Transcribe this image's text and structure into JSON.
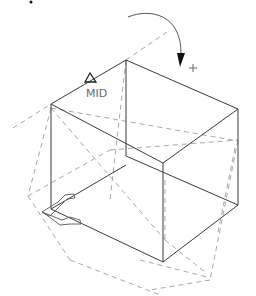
{
  "viewport": {
    "title": "Rotate 3D preview",
    "snap_marker": {
      "label": "MID",
      "glyph": "triangle-midpoint-icon",
      "position": [
        91,
        76
      ]
    },
    "rotate_indicator": {
      "glyph": "curved-rotate-arrow-icon",
      "cursor_glyph": "crosshair-plus-icon",
      "cursor_text": "+"
    },
    "ucs_icon": {
      "glyph": "ucs-axis-arrows-icon"
    },
    "colors": {
      "background": "#ffffff",
      "solid_edge": "#3a3a3a",
      "preview_edge": "#a8a8a8",
      "label": "#6a6a6a"
    }
  }
}
